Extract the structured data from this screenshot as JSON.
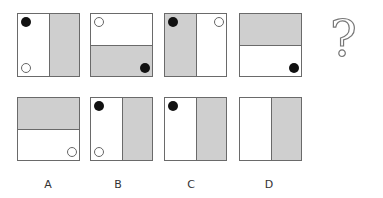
{
  "question_mark": "?",
  "labels": [
    "A",
    "B",
    "C",
    "D"
  ],
  "colors": {
    "shade": "#cfcfcf",
    "border": "#6a6a6a",
    "black_dot": "#111111"
  },
  "top_row": [
    {
      "split": "vertical",
      "shaded": "right",
      "dots": [
        {
          "color": "black",
          "pos": "top-left"
        },
        {
          "color": "white",
          "pos": "bottom-left"
        }
      ]
    },
    {
      "split": "horizontal",
      "shaded": "bottom",
      "dots": [
        {
          "color": "white",
          "pos": "top-left"
        },
        {
          "color": "black",
          "pos": "bottom-right"
        }
      ]
    },
    {
      "split": "vertical",
      "shaded": "left",
      "dots": [
        {
          "color": "black",
          "pos": "top-left"
        },
        {
          "color": "white",
          "pos": "top-right"
        }
      ]
    },
    {
      "split": "horizontal",
      "shaded": "top",
      "dots": [
        {
          "color": "black",
          "pos": "bottom-right"
        }
      ]
    }
  ],
  "options": [
    {
      "label": "A",
      "split": "horizontal",
      "shaded": "top",
      "dots": [
        {
          "color": "white",
          "pos": "bottom-right"
        }
      ]
    },
    {
      "label": "B",
      "split": "vertical",
      "shaded": "right",
      "dots": [
        {
          "color": "black",
          "pos": "top-left"
        },
        {
          "color": "white",
          "pos": "bottom-left"
        }
      ]
    },
    {
      "label": "C",
      "split": "vertical",
      "shaded": "right",
      "dots": [
        {
          "color": "black",
          "pos": "top-left"
        }
      ]
    },
    {
      "label": "D",
      "split": "vertical",
      "shaded": "right",
      "dots": []
    }
  ]
}
